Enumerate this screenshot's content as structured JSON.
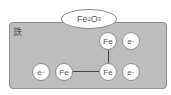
{
  "title": "鉄",
  "oxide": {
    "base": "Fe",
    "sub1": "2",
    "mid": "O",
    "sub2": "3"
  },
  "nodes": [
    {
      "id": "fe-top",
      "label": "Fe",
      "sup": "",
      "x": 108,
      "y": 41
    },
    {
      "id": "e-top",
      "label": "e",
      "sup": "−",
      "x": 131,
      "y": 41
    },
    {
      "id": "e-left",
      "label": "e",
      "sup": "−",
      "x": 41,
      "y": 72
    },
    {
      "id": "fe-left",
      "label": "Fe",
      "sup": "",
      "x": 64,
      "y": 72
    },
    {
      "id": "fe-mid",
      "label": "Fe",
      "sup": "",
      "x": 108,
      "y": 72
    },
    {
      "id": "e-right",
      "label": "e",
      "sup": "−",
      "x": 131,
      "y": 72
    }
  ],
  "links": [
    {
      "from": "fe-left",
      "to": "fe-mid"
    },
    {
      "from": "fe-top",
      "to": "fe-mid"
    }
  ],
  "colors": {
    "panel": "#bdbdbd",
    "border": "#8e8e8e",
    "node": "#ffffff",
    "text": "#555555",
    "line": "#444444"
  }
}
